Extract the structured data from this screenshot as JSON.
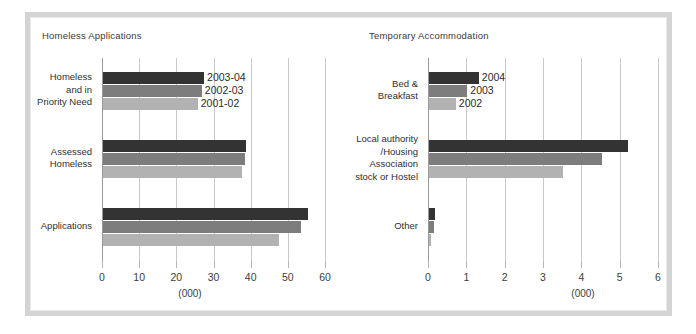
{
  "figure": {
    "background": "#ffffff",
    "frame_color": "#d4d4d4",
    "series_colors": [
      "#333333",
      "#7d7d7d",
      "#b2b2b2"
    ]
  },
  "chart_data": [
    {
      "type": "bar",
      "orientation": "horizontal",
      "title": "Homeless Applications",
      "xlabel": "(000)",
      "ylabel": "",
      "xlim": [
        0,
        60
      ],
      "xticks": [
        0,
        10,
        20,
        30,
        40,
        50,
        60
      ],
      "xticklabels": [
        "0",
        "10",
        "20",
        "30",
        "40",
        "50",
        "60"
      ],
      "grid": true,
      "legend": "inline-labels",
      "categories": [
        "Homeless and in Priority Need",
        "Assessed Homeless",
        "Applications"
      ],
      "category_lines": [
        [
          "Homeless",
          "and in",
          "Priority Need"
        ],
        [
          "Assessed",
          "Homeless"
        ],
        [
          "Applications"
        ]
      ],
      "series": [
        {
          "name": "2003-04",
          "color": "#333333",
          "values": [
            27.2,
            38.4,
            55.1
          ]
        },
        {
          "name": "2002-03",
          "color": "#7d7d7d",
          "values": [
            26.6,
            38.2,
            53.2
          ]
        },
        {
          "name": "2001-02",
          "color": "#b2b2b2",
          "values": [
            25.5,
            37.4,
            47.3
          ]
        }
      ],
      "inline_series_labels": [
        "2003-04",
        "2002-03",
        "2001-02"
      ]
    },
    {
      "type": "bar",
      "orientation": "horizontal",
      "title": "Temporary Accommodation",
      "xlabel": "(000)",
      "ylabel": "",
      "xlim": [
        0,
        6
      ],
      "xticks": [
        0,
        1,
        2,
        3,
        4,
        5,
        6
      ],
      "xticklabels": [
        "0",
        "1",
        "2",
        "3",
        "4",
        "5",
        "6"
      ],
      "grid": true,
      "legend": "inline-labels",
      "categories": [
        "Bed & Breakfast",
        "Local authority /Housing Association stock or Hostel",
        "Other"
      ],
      "category_lines": [
        [
          "Bed &",
          "Breakfast"
        ],
        [
          "Local authority",
          "/Housing",
          "Association",
          "stock or Hostel"
        ],
        [
          "Other"
        ]
      ],
      "series": [
        {
          "name": "2004",
          "color": "#333333",
          "values": [
            1.3,
            5.2,
            0.15
          ]
        },
        {
          "name": "2003",
          "color": "#7d7d7d",
          "values": [
            1.0,
            4.5,
            0.12
          ]
        },
        {
          "name": "2002",
          "color": "#b2b2b2",
          "values": [
            0.7,
            3.5,
            0.05
          ]
        }
      ],
      "inline_series_labels": [
        "2004",
        "2003",
        "2002"
      ]
    }
  ]
}
